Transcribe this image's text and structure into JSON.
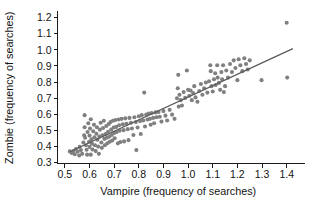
{
  "chart_data": {
    "type": "scatter",
    "title": "",
    "xlabel": "Vampire (frequency of searches)",
    "ylabel": "Zombie (frequency of searches)",
    "xlim": [
      0.47,
      1.45
    ],
    "ylim": [
      0.295,
      1.235
    ],
    "xticks": [
      0.5,
      0.6,
      0.7,
      0.8,
      0.9,
      1.0,
      1.1,
      1.2,
      1.3,
      1.4
    ],
    "xticklabels": [
      "0.5",
      "0.6",
      "0.7",
      "0.8",
      "0.9",
      "1.0",
      "1.1",
      "1.2",
      "1.3",
      "1.4"
    ],
    "yticks": [
      0.3,
      0.4,
      0.5,
      0.6,
      0.7,
      0.8,
      0.9,
      1.0,
      1.1,
      1.2
    ],
    "yticklabels": [
      "0.3",
      "0.4",
      "0.5",
      "0.6",
      "0.7",
      "0.8",
      "0.9",
      "1.0",
      "1.1",
      "1.2"
    ],
    "grid": false,
    "legend": null,
    "marker_color": "#808080",
    "marker_size": 3.0,
    "line_color": "#595959",
    "trendline": {
      "type": "linear-fit",
      "x_start": 0.52,
      "y_start": 0.368,
      "x_end": 1.425,
      "y_end": 1.008
    },
    "points": [
      [
        0.52,
        0.37
      ],
      [
        0.528,
        0.36
      ],
      [
        0.535,
        0.372
      ],
      [
        0.54,
        0.352
      ],
      [
        0.545,
        0.385
      ],
      [
        0.552,
        0.368
      ],
      [
        0.558,
        0.345
      ],
      [
        0.56,
        0.398
      ],
      [
        0.565,
        0.378
      ],
      [
        0.57,
        0.355
      ],
      [
        0.575,
        0.425
      ],
      [
        0.578,
        0.47
      ],
      [
        0.58,
        0.52
      ],
      [
        0.58,
        0.595
      ],
      [
        0.582,
        0.455
      ],
      [
        0.585,
        0.408
      ],
      [
        0.588,
        0.38
      ],
      [
        0.59,
        0.35
      ],
      [
        0.592,
        0.49
      ],
      [
        0.595,
        0.545
      ],
      [
        0.598,
        0.43
      ],
      [
        0.6,
        0.398
      ],
      [
        0.6,
        0.468
      ],
      [
        0.602,
        0.512
      ],
      [
        0.605,
        0.57
      ],
      [
        0.605,
        0.35
      ],
      [
        0.608,
        0.445
      ],
      [
        0.61,
        0.418
      ],
      [
        0.612,
        0.382
      ],
      [
        0.615,
        0.495
      ],
      [
        0.618,
        0.535
      ],
      [
        0.62,
        0.458
      ],
      [
        0.622,
        0.408
      ],
      [
        0.625,
        0.372
      ],
      [
        0.628,
        0.48
      ],
      [
        0.63,
        0.52
      ],
      [
        0.632,
        0.442
      ],
      [
        0.635,
        0.4
      ],
      [
        0.638,
        0.355
      ],
      [
        0.64,
        0.462
      ],
      [
        0.642,
        0.505
      ],
      [
        0.645,
        0.548
      ],
      [
        0.648,
        0.425
      ],
      [
        0.65,
        0.392
      ],
      [
        0.652,
        0.47
      ],
      [
        0.655,
        0.515
      ],
      [
        0.658,
        0.56
      ],
      [
        0.66,
        0.448
      ],
      [
        0.662,
        0.408
      ],
      [
        0.665,
        0.478
      ],
      [
        0.668,
        0.528
      ],
      [
        0.67,
        0.455
      ],
      [
        0.672,
        0.42
      ],
      [
        0.675,
        0.492
      ],
      [
        0.678,
        0.54
      ],
      [
        0.68,
        0.462
      ],
      [
        0.682,
        0.43
      ],
      [
        0.685,
        0.552
      ],
      [
        0.688,
        0.505
      ],
      [
        0.69,
        0.472
      ],
      [
        0.692,
        0.438
      ],
      [
        0.695,
        0.56
      ],
      [
        0.698,
        0.518
      ],
      [
        0.7,
        0.485
      ],
      [
        0.702,
        0.452
      ],
      [
        0.705,
        0.565
      ],
      [
        0.708,
        0.522
      ],
      [
        0.71,
        0.49
      ],
      [
        0.715,
        0.42
      ],
      [
        0.718,
        0.568
      ],
      [
        0.72,
        0.532
      ],
      [
        0.722,
        0.498
      ],
      [
        0.725,
        0.428
      ],
      [
        0.73,
        0.572
      ],
      [
        0.735,
        0.538
      ],
      [
        0.738,
        0.502
      ],
      [
        0.74,
        0.432
      ],
      [
        0.745,
        0.575
      ],
      [
        0.75,
        0.542
      ],
      [
        0.755,
        0.508
      ],
      [
        0.758,
        0.44
      ],
      [
        0.762,
        0.578
      ],
      [
        0.768,
        0.548
      ],
      [
        0.772,
        0.512
      ],
      [
        0.778,
        0.472
      ],
      [
        0.782,
        0.582
      ],
      [
        0.788,
        0.552
      ],
      [
        0.79,
        0.378
      ],
      [
        0.795,
        0.518
      ],
      [
        0.8,
        0.588
      ],
      [
        0.805,
        0.558
      ],
      [
        0.808,
        0.478
      ],
      [
        0.812,
        0.595
      ],
      [
        0.818,
        0.562
      ],
      [
        0.822,
        0.735
      ],
      [
        0.825,
        0.525
      ],
      [
        0.83,
        0.598
      ],
      [
        0.835,
        0.568
      ],
      [
        0.84,
        0.605
      ],
      [
        0.845,
        0.572
      ],
      [
        0.848,
        0.535
      ],
      [
        0.852,
        0.608
      ],
      [
        0.858,
        0.578
      ],
      [
        0.862,
        0.545
      ],
      [
        0.868,
        0.612
      ],
      [
        0.872,
        0.582
      ],
      [
        0.88,
        0.615
      ],
      [
        0.885,
        0.585
      ],
      [
        0.892,
        0.555
      ],
      [
        0.9,
        0.62
      ],
      [
        0.908,
        0.592
      ],
      [
        0.915,
        0.562
      ],
      [
        0.925,
        0.628
      ],
      [
        0.935,
        0.598
      ],
      [
        0.945,
        0.572
      ],
      [
        0.955,
        0.7
      ],
      [
        0.958,
        0.762
      ],
      [
        0.96,
        0.845
      ],
      [
        0.962,
        0.648
      ],
      [
        0.965,
        0.722
      ],
      [
        0.97,
        0.688
      ],
      [
        0.975,
        0.655
      ],
      [
        0.982,
        0.738
      ],
      [
        0.988,
        0.702
      ],
      [
        0.995,
        0.872
      ],
      [
        1.0,
        0.752
      ],
      [
        1.005,
        0.715
      ],
      [
        1.01,
        0.748
      ],
      [
        1.015,
        0.688
      ],
      [
        1.02,
        0.732
      ],
      [
        1.025,
        0.775
      ],
      [
        1.03,
        0.705
      ],
      [
        1.038,
        0.678
      ],
      [
        1.045,
        0.745
      ],
      [
        1.052,
        0.788
      ],
      [
        1.058,
        0.722
      ],
      [
        1.065,
        0.762
      ],
      [
        1.072,
        0.798
      ],
      [
        1.078,
        0.735
      ],
      [
        1.085,
        0.805
      ],
      [
        1.09,
        0.905
      ],
      [
        1.092,
        0.868
      ],
      [
        1.095,
        0.775
      ],
      [
        1.1,
        0.742
      ],
      [
        1.105,
        0.818
      ],
      [
        1.11,
        0.855
      ],
      [
        1.112,
        0.782
      ],
      [
        1.118,
        0.905
      ],
      [
        1.12,
        0.828
      ],
      [
        1.125,
        0.795
      ],
      [
        1.13,
        0.752
      ],
      [
        1.135,
        0.862
      ],
      [
        1.138,
        0.818
      ],
      [
        1.142,
        0.905
      ],
      [
        1.145,
        0.738
      ],
      [
        1.15,
        0.775
      ],
      [
        1.155,
        0.872
      ],
      [
        1.162,
        0.828
      ],
      [
        1.17,
        0.912
      ],
      [
        1.178,
        0.862
      ],
      [
        1.185,
        0.935
      ],
      [
        1.192,
        0.888
      ],
      [
        1.2,
        0.812
      ],
      [
        1.205,
        0.942
      ],
      [
        1.212,
        0.905
      ],
      [
        1.22,
        0.868
      ],
      [
        1.228,
        0.948
      ],
      [
        1.235,
        0.912
      ],
      [
        1.242,
        0.878
      ],
      [
        1.25,
        0.935
      ],
      [
        1.298,
        0.812
      ],
      [
        1.4,
        1.168
      ],
      [
        1.402,
        0.828
      ]
    ]
  }
}
